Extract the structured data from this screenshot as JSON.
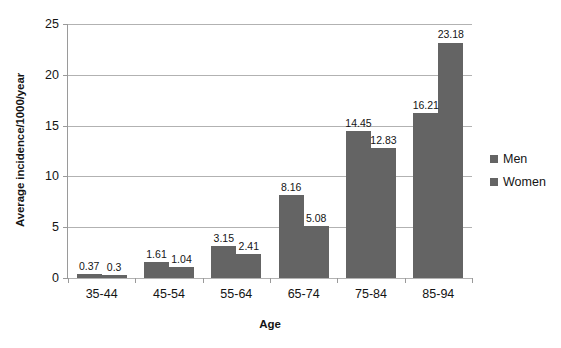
{
  "chart_data": {
    "type": "bar",
    "title": "",
    "xlabel": "Age",
    "ylabel": "Average incidence/1000/year",
    "categories": [
      "35-44",
      "45-54",
      "55-64",
      "65-74",
      "75-84",
      "85-94"
    ],
    "series": [
      {
        "name": "Men",
        "color": "#646464",
        "values": [
          0.37,
          1.61,
          3.15,
          8.16,
          14.45,
          16.21
        ],
        "labels": [
          "0.37",
          "1.61",
          "3.15",
          "8.16",
          "14.45",
          "16.21"
        ]
      },
      {
        "name": "Women",
        "color": "#646464",
        "values": [
          0.3,
          1.04,
          2.41,
          5.08,
          12.83,
          23.18
        ],
        "labels": [
          "0.3",
          "1.04",
          "2.41",
          "5.08",
          "12.83",
          "23.18"
        ]
      }
    ],
    "ylim": [
      0,
      25
    ],
    "yticks": [
      0,
      5,
      10,
      15,
      20,
      25
    ],
    "ytick_labels": [
      "0",
      "5",
      "10",
      "15",
      "20",
      "25"
    ],
    "grid": true,
    "legend_position": "right"
  }
}
